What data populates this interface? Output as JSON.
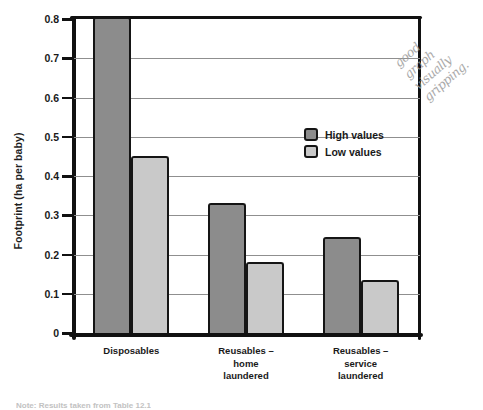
{
  "chart_data": {
    "type": "bar",
    "title": "",
    "xlabel": "",
    "ylabel": "Footprint (ha per baby)",
    "ylim": [
      0,
      0.8
    ],
    "yticks": [
      "0",
      "0.1",
      "0.2",
      "0.3",
      "0.4",
      "0.5",
      "0.6",
      "0.7",
      "0.8"
    ],
    "ytick_values": [
      0,
      0.1,
      0.2,
      0.3,
      0.4,
      0.5,
      0.6,
      0.7,
      0.8
    ],
    "grid": true,
    "legend_position": "upper-center",
    "categories": [
      "Disposables",
      "Reusables – home laundered",
      "Reusables – service laundered"
    ],
    "category_lines": [
      [
        "Disposables"
      ],
      [
        "Reusables –",
        "home",
        "laundered"
      ],
      [
        "Reusables –",
        "service",
        "laundered"
      ]
    ],
    "series": [
      {
        "name": "High values",
        "color": "#8c8c8c",
        "values": [
          0.8,
          0.325,
          0.24
        ]
      },
      {
        "name": "Low values",
        "color": "#c9c9c9",
        "values": [
          0.445,
          0.175,
          0.13
        ]
      }
    ]
  },
  "annotation": {
    "handwritten_lines": [
      "good",
      "graph",
      "visually",
      "gripping."
    ]
  },
  "footer": {
    "source_note": "Note: Results taken from Table 12.1"
  }
}
